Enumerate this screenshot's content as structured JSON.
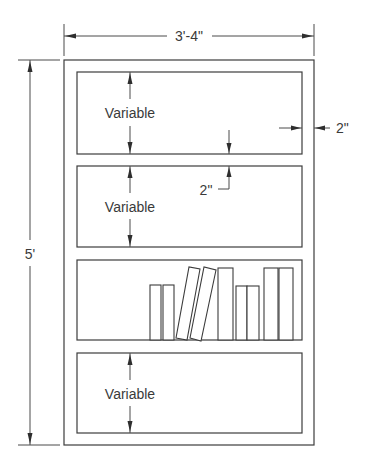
{
  "drawing": {
    "title": "Bookshelf elevation",
    "dimensions": {
      "overall_width": "3'-4\"",
      "overall_height": "5'",
      "side_thickness": "2\"",
      "shelf_thickness": "2\""
    },
    "shelves": [
      {
        "label": "Variable",
        "has_books": false
      },
      {
        "label": "Variable",
        "has_books": false
      },
      {
        "label": "",
        "has_books": true
      },
      {
        "label": "Variable",
        "has_books": false
      }
    ],
    "books_count": 9,
    "colors": {
      "line": "#3c3c3c",
      "text": "#3a3a3a",
      "background": "#ffffff"
    }
  }
}
